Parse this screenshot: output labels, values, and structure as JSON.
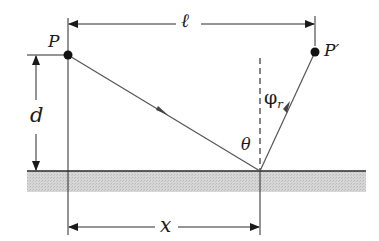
{
  "diagram": {
    "type": "reflection-geometry",
    "labels": {
      "source_point": "P",
      "image_point": "P′",
      "horizontal_separation": "ℓ",
      "height": "d",
      "reflection_distance": "x",
      "incidence_angle": "θ",
      "reflection_angle": "φ",
      "reflection_angle_subscript": "r"
    },
    "points": {
      "P": [
        68,
        55
      ],
      "P_prime": [
        315,
        52
      ],
      "reflection": [
        260,
        171
      ]
    },
    "surface": {
      "x_start": 27,
      "x_end": 366,
      "y_top": 171,
      "y_bottom": 192
    },
    "colors": {
      "line": "#2a2a2a",
      "ray": "#555555",
      "surface_fill": "#cfcfcf",
      "background": "#ffffff"
    }
  }
}
